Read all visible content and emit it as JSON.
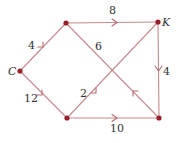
{
  "diagram": {
    "type": "directed-weighted-graph",
    "colors": {
      "edge": "#c48a8e",
      "arrow": "#b76b72",
      "node": "#9b1f2a",
      "text": "#333333"
    },
    "nodes": [
      {
        "id": "C",
        "label": "C",
        "x": 20,
        "y": 71
      },
      {
        "id": "A",
        "label": "",
        "x": 66,
        "y": 23
      },
      {
        "id": "K",
        "label": "K",
        "x": 158,
        "y": 22
      },
      {
        "id": "B",
        "label": "",
        "x": 67,
        "y": 118
      },
      {
        "id": "D",
        "label": "",
        "x": 159,
        "y": 118
      }
    ],
    "edges": [
      {
        "from": "C",
        "to": "A",
        "weight": "4"
      },
      {
        "from": "C",
        "to": "B",
        "weight": "12"
      },
      {
        "from": "A",
        "to": "K",
        "weight": "8"
      },
      {
        "from": "B",
        "to": "K",
        "weight": "2"
      },
      {
        "from": "D",
        "to": "A",
        "weight": "6"
      },
      {
        "from": "K",
        "to": "D",
        "weight": "4"
      },
      {
        "from": "B",
        "to": "D",
        "weight": "10"
      }
    ]
  }
}
